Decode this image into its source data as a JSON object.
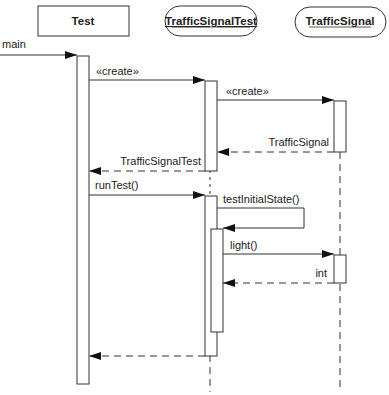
{
  "diagram": {
    "type": "UML sequence diagram",
    "participants": [
      {
        "id": "test",
        "label": "Test",
        "shape": "rectangle",
        "underlined": false
      },
      {
        "id": "trafficSignalTest",
        "label": "TrafficSignalTest",
        "shape": "rounded",
        "underlined": true
      },
      {
        "id": "trafficSignal",
        "label": "TrafficSignal",
        "shape": "rounded",
        "underlined": true
      }
    ],
    "messages": [
      {
        "from": "external",
        "to": "test",
        "label": "main",
        "kind": "call"
      },
      {
        "from": "test",
        "to": "trafficSignalTest",
        "label": "«create»",
        "kind": "create"
      },
      {
        "from": "trafficSignalTest",
        "to": "trafficSignal",
        "label": "«create»",
        "kind": "create"
      },
      {
        "from": "trafficSignal",
        "to": "trafficSignalTest",
        "label": "TrafficSignal",
        "kind": "return"
      },
      {
        "from": "trafficSignalTest",
        "to": "test",
        "label": "TrafficSignalTest",
        "kind": "return"
      },
      {
        "from": "test",
        "to": "trafficSignalTest",
        "label": "runTest()",
        "kind": "call"
      },
      {
        "from": "trafficSignalTest",
        "to": "trafficSignalTest",
        "label": "testInitialState()",
        "kind": "self-call"
      },
      {
        "from": "trafficSignalTest",
        "to": "trafficSignal",
        "label": "light()",
        "kind": "call"
      },
      {
        "from": "trafficSignal",
        "to": "trafficSignalTest",
        "label": "int",
        "kind": "return"
      },
      {
        "from": "trafficSignalTest",
        "to": "test",
        "label": "",
        "kind": "return"
      }
    ]
  }
}
